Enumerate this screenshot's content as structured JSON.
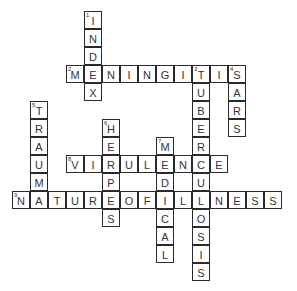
{
  "puzzle": {
    "type": "crossword",
    "cell_size": 18,
    "origin_x": 12,
    "origin_y": 11,
    "words": [
      {
        "number": 1,
        "direction": "down",
        "answer": "INDEX",
        "row": 0,
        "col": 4
      },
      {
        "number": 2,
        "direction": "across",
        "answer": "MENINGITIS",
        "row": 3,
        "col": 3
      },
      {
        "number": 3,
        "direction": "down",
        "answer": "TUBERCULOSIS",
        "row": 3,
        "col": 10
      },
      {
        "number": 4,
        "direction": "down",
        "answer": "SARS",
        "row": 3,
        "col": 12
      },
      {
        "number": 5,
        "direction": "down",
        "answer": "TRAUMA",
        "row": 5,
        "col": 1
      },
      {
        "number": 6,
        "direction": "down",
        "answer": "HERPES",
        "row": 6,
        "col": 5
      },
      {
        "number": 7,
        "direction": "down",
        "answer": "MEDICAL",
        "row": 7,
        "col": 8
      },
      {
        "number": 8,
        "direction": "across",
        "answer": "VIRULENCE",
        "row": 8,
        "col": 3
      },
      {
        "number": 9,
        "direction": "across",
        "answer": "NATUREOFILLNESS",
        "row": 10,
        "col": 0
      }
    ]
  },
  "colors": {
    "border": "#2a2a2a",
    "text": "#333333",
    "background": "#ffffff"
  }
}
